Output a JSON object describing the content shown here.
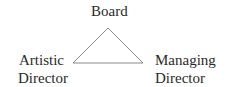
{
  "diagram": {
    "nodes": [
      {
        "id": "board",
        "lines": [
          "Board"
        ]
      },
      {
        "id": "artistic",
        "lines": [
          "Artistic",
          "Director"
        ]
      },
      {
        "id": "managing",
        "lines": [
          "Managing",
          "Director"
        ]
      }
    ],
    "edges": [
      {
        "from": "board",
        "to": "artistic"
      },
      {
        "from": "board",
        "to": "managing"
      },
      {
        "from": "artistic",
        "to": "managing"
      }
    ],
    "line_color": "#8a8a8a"
  }
}
